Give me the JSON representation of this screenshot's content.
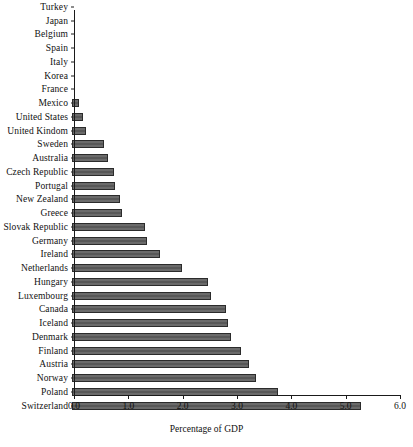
{
  "chart_data": {
    "type": "bar",
    "orientation": "horizontal",
    "title": "",
    "xlabel": "Percentage of GDP",
    "ylabel": "",
    "xlim": [
      0.0,
      6.0
    ],
    "xticks": [
      "0.0",
      "1.0",
      "2.0",
      "3.0",
      "4.0",
      "5.0",
      "6.0"
    ],
    "xtick_values": [
      0.0,
      1.0,
      2.0,
      3.0,
      4.0,
      5.0,
      6.0
    ],
    "grid": false,
    "legend": null,
    "bar_color": "#5e5e5e",
    "bar_edge_color": "#2b2b2b",
    "categories": [
      "Turkey",
      "Japan",
      "Belgium",
      "Spain",
      "Italy",
      "Korea",
      "France",
      "Mexico",
      "United States",
      "United Kindom",
      "Sweden",
      "Australia",
      "Czech Republic",
      "Portugal",
      "New Zealand",
      "Greece",
      "Slovak Republic",
      "Germany",
      "Ireland",
      "Netherlands",
      "Hungary",
      "Luxembourg",
      "Canada",
      "Iceland",
      "Denmark",
      "Finland",
      "Austria",
      "Norway",
      "Poland",
      "Switzerland"
    ],
    "values": [
      0.0,
      0.0,
      0.0,
      0.0,
      0.0,
      0.0,
      0.0,
      0.13,
      0.2,
      0.25,
      0.58,
      0.66,
      0.78,
      0.8,
      0.88,
      0.92,
      1.35,
      1.38,
      1.62,
      2.03,
      2.5,
      2.55,
      2.84,
      2.87,
      2.93,
      3.11,
      3.26,
      3.39,
      3.79,
      5.32
    ]
  }
}
